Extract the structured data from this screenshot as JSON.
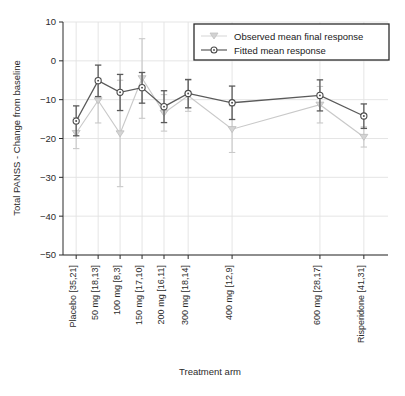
{
  "chart_data": {
    "type": "line",
    "title": "",
    "xlabel": "Treatment arm",
    "ylabel": "Total PANSS - Change from baseline",
    "categories": [
      "Placebo [35,21]",
      "50 mg [18,13]",
      "100 mg [8,3]",
      "150 mg [17,10]",
      "200 mg [16,11]",
      "300 mg [18,14]",
      "400 mg [12,9]",
      "600 mg [28,17]",
      "Risperidone [41,31]"
    ],
    "x_positions": [
      0,
      1,
      2,
      3,
      4,
      5.1,
      7.1,
      11.1,
      13.1
    ],
    "xlim": [
      -0.6,
      14.2
    ],
    "ylim": [
      -50,
      10
    ],
    "yticks": [
      10,
      0,
      -10,
      -20,
      -30,
      -40,
      -50
    ],
    "ytick_labels": [
      "10",
      "0",
      "−10",
      "−20",
      "−30",
      "−40",
      "−50"
    ],
    "grid": true,
    "legend_position": "top-right",
    "series": [
      {
        "name": "Observed mean final response",
        "marker": "triangle-down",
        "color": "#c9c9c9",
        "values": [
          -18.6,
          -10.2,
          -18.7,
          -4.5,
          -13.4,
          -9.0,
          -17.6,
          -11.3,
          -19.6
        ],
        "err_low": [
          -22.6,
          -16.0,
          -32.4,
          -14.8,
          -18.1,
          -13.0,
          -23.6,
          -16.0,
          -22.2
        ],
        "err_high": [
          -14.6,
          -4.5,
          -5.0,
          5.7,
          -8.7,
          -5.0,
          -11.6,
          -6.6,
          -17.0
        ]
      },
      {
        "name": "Fitted mean response",
        "marker": "circle",
        "color": "#5a5a5a",
        "values": [
          -15.5,
          -5.1,
          -8.1,
          -6.9,
          -11.8,
          -8.4,
          -10.8,
          -8.9,
          -14.2
        ],
        "err_low": [
          -19.3,
          -9.2,
          -12.8,
          -10.9,
          -15.9,
          -12.1,
          -15.1,
          -12.9,
          -17.4
        ],
        "err_high": [
          -11.6,
          -1.1,
          -3.5,
          -3.0,
          -7.7,
          -4.8,
          -6.5,
          -4.9,
          -11.1
        ]
      }
    ]
  },
  "legend": {
    "items": [
      {
        "label": "Observed mean final response"
      },
      {
        "label": "Fitted mean response"
      }
    ]
  },
  "colors": {
    "observed": "#c9c9c9",
    "fitted": "#5a5a5a",
    "axis": "#2b2b2b",
    "grid": "#e2e2e2",
    "background": "#ffffff"
  }
}
